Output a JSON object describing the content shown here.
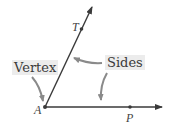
{
  "diagram": {
    "labels": {
      "vertex": "Vertex",
      "sides": "Sides"
    },
    "points": {
      "A": "A",
      "T": "T",
      "P": "P"
    },
    "colors": {
      "line": "#3a3a3a",
      "callout_arrow": "#8a8a8a",
      "label_bg": "#ececec"
    }
  }
}
